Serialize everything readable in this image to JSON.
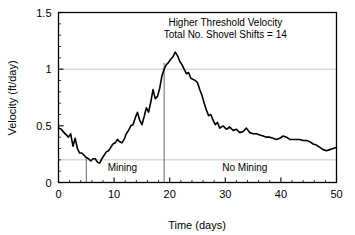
{
  "chart_data": {
    "type": "line",
    "title": "",
    "xlabel": "Time (days)",
    "ylabel": "Velocity (ft/day)",
    "xlim": [
      0,
      50
    ],
    "ylim": [
      0,
      1.5
    ],
    "xticks": [
      0,
      10,
      20,
      30,
      40,
      50
    ],
    "xtick_labels": [
      "0",
      "10",
      "20",
      "30",
      "40",
      "50"
    ],
    "yticks": [
      0,
      0.5,
      1,
      1.5
    ],
    "ytick_labels": [
      "0",
      "0.5",
      "1",
      "1.5"
    ],
    "minor_xtick_step": 2,
    "minor_ytick_step": 0.1,
    "grid": true,
    "gridlines_y": [
      0.2,
      1.0
    ],
    "grid_color": "#bfbfbf",
    "legend": "none",
    "line_color": "#000000",
    "line_width": 1.6,
    "annotations": [
      {
        "name": "threshold-annotation",
        "lines": [
          "Higher Threshold Velocity",
          "Total No. Shovel Shifts = 14"
        ],
        "x": 30,
        "y": 1.38
      },
      {
        "name": "mining-region-label",
        "lines": [
          "Mining"
        ],
        "x": 11.5,
        "y": 0.1
      },
      {
        "name": "no-mining-region-label",
        "lines": [
          "No Mining"
        ],
        "x": 33.5,
        "y": 0.1
      }
    ],
    "vlines": [
      {
        "name": "mining-start-divider",
        "x": 5,
        "y0": 0,
        "y1": 0.225
      },
      {
        "name": "mining-end-divider",
        "x": 19,
        "y0": 0,
        "y1": 1.055
      }
    ],
    "series": [
      {
        "name": "velocity",
        "x": [
          0,
          0.5,
          1,
          1.4,
          1.8,
          2.2,
          2.6,
          3,
          3.4,
          3.8,
          4.2,
          4.6,
          5,
          5.4,
          5.8,
          6.2,
          6.6,
          7,
          7.4,
          7.8,
          8.2,
          8.6,
          9,
          9.4,
          9.8,
          10.2,
          10.6,
          11,
          11.4,
          11.8,
          12.2,
          12.6,
          13,
          13.4,
          13.8,
          14.2,
          14.6,
          15,
          15.4,
          15.8,
          16.2,
          16.6,
          17,
          17.4,
          17.8,
          18.2,
          18.6,
          19,
          19.4,
          19.8,
          20.2,
          20.6,
          21,
          21.4,
          21.8,
          22.2,
          22.6,
          23,
          23.4,
          23.8,
          24.2,
          24.6,
          25,
          25.4,
          25.8,
          26.2,
          26.6,
          27,
          27.4,
          27.8,
          28.2,
          28.6,
          29,
          29.6,
          30.2,
          30.8,
          31.4,
          32,
          32.6,
          33.2,
          33.8,
          34.4,
          35,
          35.6,
          36.2,
          36.8,
          37.4,
          38,
          38.6,
          39.2,
          39.8,
          40.4,
          41,
          41.6,
          42.2,
          42.8,
          43.4,
          44,
          44.6,
          45.2,
          45.8,
          46.4,
          47,
          47.6,
          48.2,
          48.8,
          49.4,
          50
        ],
        "values": [
          0.48,
          0.47,
          0.44,
          0.42,
          0.4,
          0.43,
          0.32,
          0.39,
          0.3,
          0.26,
          0.26,
          0.24,
          0.22,
          0.21,
          0.19,
          0.21,
          0.21,
          0.18,
          0.17,
          0.21,
          0.24,
          0.27,
          0.28,
          0.31,
          0.34,
          0.35,
          0.38,
          0.36,
          0.35,
          0.38,
          0.43,
          0.46,
          0.5,
          0.51,
          0.57,
          0.62,
          0.55,
          0.51,
          0.58,
          0.66,
          0.62,
          0.71,
          0.82,
          0.74,
          0.76,
          0.83,
          0.94,
          1.0,
          1.04,
          1.06,
          1.09,
          1.11,
          1.15,
          1.12,
          1.07,
          1.04,
          1.0,
          0.96,
          0.97,
          0.92,
          0.91,
          0.9,
          0.88,
          0.82,
          0.77,
          0.7,
          0.64,
          0.59,
          0.6,
          0.55,
          0.51,
          0.53,
          0.48,
          0.5,
          0.47,
          0.49,
          0.46,
          0.47,
          0.44,
          0.45,
          0.48,
          0.44,
          0.43,
          0.43,
          0.42,
          0.41,
          0.4,
          0.4,
          0.39,
          0.38,
          0.39,
          0.41,
          0.4,
          0.38,
          0.38,
          0.38,
          0.38,
          0.37,
          0.37,
          0.36,
          0.34,
          0.33,
          0.31,
          0.29,
          0.28,
          0.29,
          0.3,
          0.31
        ]
      }
    ]
  },
  "axes": {
    "frame_color": "#000000"
  }
}
